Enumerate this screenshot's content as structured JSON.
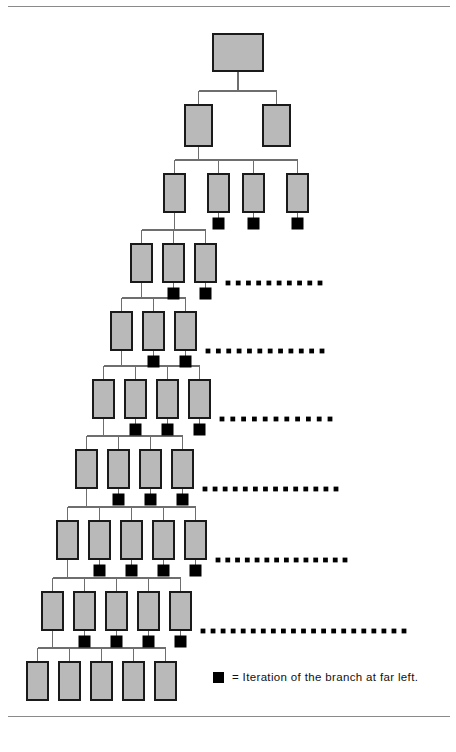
{
  "figure": {
    "background_color": "#ffffff",
    "box_fill_color": "#b9b9b9",
    "box_stroke_color": "#1a1a1a",
    "connector_color": "#6e6e6e",
    "iteration_marker_color": "#000000",
    "rule_color": "#8a8a8a"
  },
  "legend": {
    "marker_name": "black-square",
    "equals_sign": "=",
    "text": "Iteration of the branch at far left.",
    "full_text": "= Iteration of the branch at far left."
  },
  "rules": [
    {
      "name": "top-rule",
      "x1": 8,
      "y": 6,
      "x2": 450,
      "color": "#c9c9c9"
    },
    {
      "name": "bottom-rule",
      "x1": 8,
      "y": 716,
      "x2": 450,
      "color": "#8a8a8a"
    }
  ],
  "chart_data": {
    "type": "diagram",
    "diagram_kind": "hierarchical-tree-with-iteration-markers",
    "title": "Iteration of the branch at far left",
    "level_count": 10,
    "levels": [
      {
        "level": 1,
        "label": "root",
        "box_count": 1,
        "box_width": 50,
        "box_height": 37,
        "y": 34,
        "boxes": [
          {
            "index": 1,
            "x": 213,
            "iteration_marker": false
          }
        ],
        "dots": null
      },
      {
        "level": 2,
        "label": "level-2",
        "box_count": 2,
        "box_width": 27,
        "box_height": 41,
        "y": 105,
        "boxes": [
          {
            "index": 1,
            "x": 185,
            "iteration_marker": false
          },
          {
            "index": 2,
            "x": 263,
            "iteration_marker": false
          }
        ],
        "dots": null
      },
      {
        "level": 3,
        "label": "level-3",
        "box_count": 4,
        "box_width": 21,
        "box_height": 38,
        "y": 174,
        "boxes": [
          {
            "index": 1,
            "x": 164,
            "iteration_marker": false
          },
          {
            "index": 2,
            "x": 208,
            "iteration_marker": true
          },
          {
            "index": 3,
            "x": 243,
            "iteration_marker": true
          },
          {
            "index": 4,
            "x": 287,
            "iteration_marker": true
          }
        ],
        "dots": null
      },
      {
        "level": 4,
        "label": "level-4",
        "box_count": 3,
        "box_width": 21,
        "box_height": 38,
        "y": 244,
        "boxes": [
          {
            "index": 1,
            "x": 131,
            "iteration_marker": false
          },
          {
            "index": 2,
            "x": 163,
            "iteration_marker": true
          },
          {
            "index": 3,
            "x": 195,
            "iteration_marker": true
          }
        ],
        "dots": {
          "start_x": 228,
          "end_x": 320,
          "y": 283,
          "count": 10,
          "radius": 2.4
        }
      },
      {
        "level": 5,
        "label": "level-5",
        "box_count": 3,
        "box_width": 21,
        "box_height": 38,
        "y": 312,
        "boxes": [
          {
            "index": 1,
            "x": 111,
            "iteration_marker": false
          },
          {
            "index": 2,
            "x": 143,
            "iteration_marker": true
          },
          {
            "index": 3,
            "x": 175,
            "iteration_marker": true
          }
        ],
        "dots": {
          "start_x": 208,
          "end_x": 322,
          "y": 351,
          "count": 12,
          "radius": 2.4
        }
      },
      {
        "level": 6,
        "label": "level-6",
        "box_count": 4,
        "box_width": 21,
        "box_height": 38,
        "y": 380,
        "boxes": [
          {
            "index": 1,
            "x": 93,
            "iteration_marker": false
          },
          {
            "index": 2,
            "x": 125,
            "iteration_marker": true
          },
          {
            "index": 3,
            "x": 157,
            "iteration_marker": true
          },
          {
            "index": 4,
            "x": 189,
            "iteration_marker": true
          }
        ],
        "dots": {
          "start_x": 222,
          "end_x": 330,
          "y": 419,
          "count": 11,
          "radius": 2.4
        }
      },
      {
        "level": 7,
        "label": "level-7",
        "box_count": 4,
        "box_width": 21,
        "box_height": 38,
        "y": 450,
        "boxes": [
          {
            "index": 1,
            "x": 76,
            "iteration_marker": false
          },
          {
            "index": 2,
            "x": 108,
            "iteration_marker": true
          },
          {
            "index": 3,
            "x": 140,
            "iteration_marker": true
          },
          {
            "index": 4,
            "x": 172,
            "iteration_marker": true
          }
        ],
        "dots": {
          "start_x": 205,
          "end_x": 336,
          "y": 489,
          "count": 14,
          "radius": 2.4
        }
      },
      {
        "level": 8,
        "label": "level-8",
        "box_count": 5,
        "box_width": 21,
        "box_height": 38,
        "y": 521,
        "boxes": [
          {
            "index": 1,
            "x": 57,
            "iteration_marker": false
          },
          {
            "index": 2,
            "x": 89,
            "iteration_marker": true
          },
          {
            "index": 3,
            "x": 121,
            "iteration_marker": true
          },
          {
            "index": 4,
            "x": 153,
            "iteration_marker": true
          },
          {
            "index": 5,
            "x": 185,
            "iteration_marker": true
          }
        ],
        "dots": {
          "start_x": 218,
          "end_x": 345,
          "y": 560,
          "count": 14,
          "radius": 2.4
        }
      },
      {
        "level": 9,
        "label": "level-9",
        "box_count": 5,
        "box_width": 21,
        "box_height": 38,
        "y": 592,
        "boxes": [
          {
            "index": 1,
            "x": 42,
            "iteration_marker": false
          },
          {
            "index": 2,
            "x": 74,
            "iteration_marker": true
          },
          {
            "index": 3,
            "x": 106,
            "iteration_marker": true
          },
          {
            "index": 4,
            "x": 138,
            "iteration_marker": true
          },
          {
            "index": 5,
            "x": 170,
            "iteration_marker": true
          }
        ],
        "dots": {
          "start_x": 203,
          "end_x": 404,
          "y": 631,
          "count": 21,
          "radius": 2.4
        }
      },
      {
        "level": 10,
        "label": "level-10-leaves",
        "box_count": 5,
        "box_width": 21,
        "box_height": 38,
        "y": 662,
        "boxes": [
          {
            "index": 1,
            "x": 27,
            "iteration_marker": false
          },
          {
            "index": 2,
            "x": 59,
            "iteration_marker": false
          },
          {
            "index": 3,
            "x": 91,
            "iteration_marker": false
          },
          {
            "index": 4,
            "x": 123,
            "iteration_marker": false
          },
          {
            "index": 5,
            "x": 155,
            "iteration_marker": false
          }
        ],
        "dots": null
      }
    ],
    "iteration_marker": {
      "size": 11,
      "offset_below_box": 6,
      "meaning": "Iteration of the branch at far left."
    },
    "edges_note": "Each level's first (left-most) box is the parent of the next level; orthogonal elbow connectors drop from parent bottom to a horizontal bus, then up into each child top.",
    "legend_position": "bottom-right",
    "legend_swatch": {
      "x": 213,
      "y": 672,
      "size": 11
    },
    "legend_label_x": 232,
    "legend_label_y": 678
  }
}
